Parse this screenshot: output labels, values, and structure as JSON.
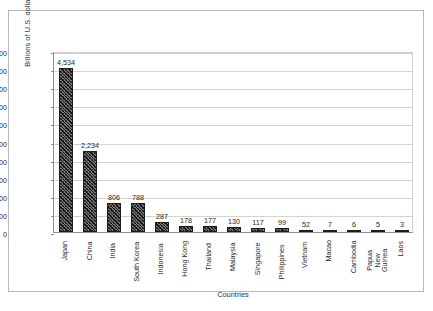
{
  "chart_data": {
    "type": "bar",
    "title": "",
    "xlabel": "Countries",
    "ylabel": "Billions of U.S. dollars",
    "ylim": [
      0,
      5000
    ],
    "ytick_labels": [
      "5,000",
      "4,500",
      "4,000",
      "3,500",
      "3,000",
      "2,500",
      "2,000",
      "1,500",
      "1,000",
      "500",
      "0"
    ],
    "ytick_values": [
      5000,
      4500,
      4000,
      3500,
      3000,
      2500,
      2000,
      1500,
      1000,
      500,
      0
    ],
    "grid": true,
    "legend": false,
    "categories": [
      "Japan",
      "China",
      "India",
      "South Korea",
      "Indonesia",
      "Hong Kong",
      "Thailand",
      "Malaysia",
      "Singapore",
      "Philippines",
      "Vietnam",
      "Macao",
      "Cambodia",
      "Papua New Guinea",
      "Laos"
    ],
    "values": [
      4534,
      2234,
      806,
      788,
      287,
      178,
      177,
      130,
      117,
      99,
      52,
      7,
      6,
      5,
      3
    ],
    "data_labels": [
      "4,534",
      "2,234",
      "806",
      "788",
      "287",
      "178",
      "177",
      "130",
      "117",
      "99",
      "52",
      "7",
      "6",
      "5",
      "3"
    ]
  },
  "figure": {
    "caption": ""
  }
}
